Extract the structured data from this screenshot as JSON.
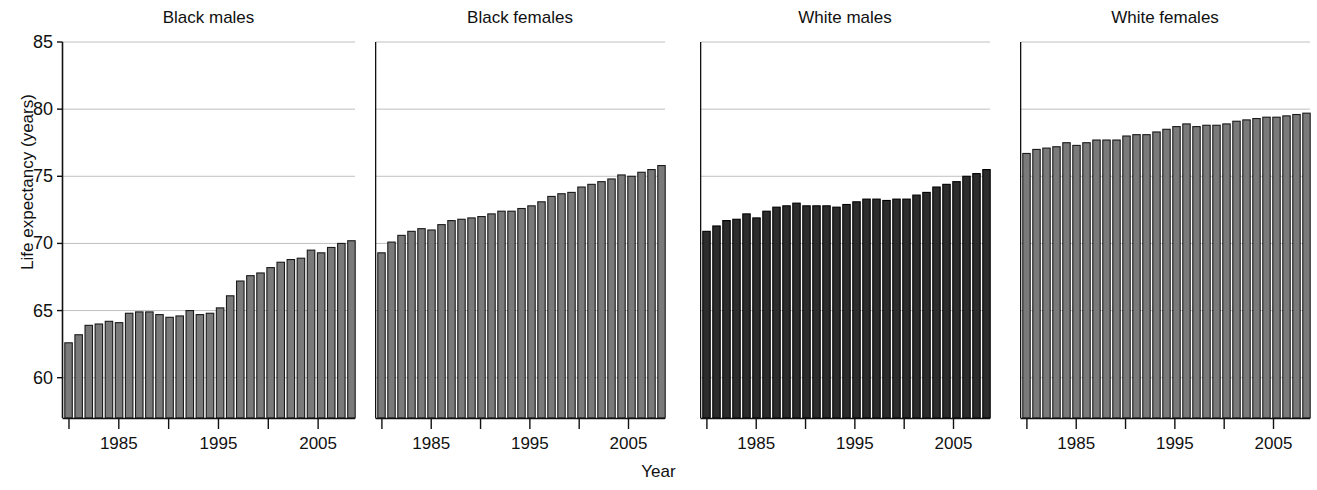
{
  "chart_data": {
    "type": "bar",
    "title": "",
    "xlabel": "Year",
    "ylabel": "Life expectancy (years)",
    "ylim": [
      57,
      85
    ],
    "ytick_values": [
      60,
      65,
      70,
      75,
      80,
      85
    ],
    "ytick_labels": [
      "60",
      "65",
      "70",
      "75",
      "80",
      "85"
    ],
    "xlim": [
      1979.3,
      2008.7
    ],
    "xtick_values": [
      1980,
      1985,
      1990,
      1995,
      2000,
      2005
    ],
    "xtick_labels": [
      "",
      "1985",
      "",
      "1995",
      "",
      "2005"
    ],
    "grid": "horizontal",
    "legend": "none",
    "x": [
      1980,
      1981,
      1982,
      1983,
      1984,
      1985,
      1986,
      1987,
      1988,
      1989,
      1990,
      1991,
      1992,
      1993,
      1994,
      1995,
      1996,
      1997,
      1998,
      1999,
      2000,
      2001,
      2002,
      2003,
      2004,
      2005,
      2006,
      2007,
      2008
    ],
    "panels": [
      {
        "label": "Black males",
        "bar_color": "#7a7a7a",
        "bar_edge_color": "#1a1a1a",
        "values": [
          62.6,
          63.2,
          63.9,
          64.0,
          64.2,
          64.1,
          64.8,
          64.9,
          64.9,
          64.7,
          64.5,
          64.6,
          65.0,
          64.7,
          64.8,
          65.2,
          66.1,
          67.2,
          67.6,
          67.8,
          68.2,
          68.6,
          68.8,
          68.9,
          69.5,
          69.3,
          69.7,
          70.0,
          70.2
        ]
      },
      {
        "label": "Black females",
        "bar_color": "#7a7a7a",
        "bar_edge_color": "#1a1a1a",
        "values": [
          69.3,
          70.1,
          70.6,
          70.9,
          71.1,
          71.0,
          71.4,
          71.7,
          71.8,
          71.9,
          72.0,
          72.2,
          72.4,
          72.4,
          72.6,
          72.8,
          73.1,
          73.5,
          73.7,
          73.8,
          74.2,
          74.4,
          74.6,
          74.8,
          75.1,
          75.0,
          75.3,
          75.5,
          75.8
        ]
      },
      {
        "label": "White males",
        "bar_color": "#2c2c2c",
        "bar_edge_color": "#000000",
        "values": [
          70.9,
          71.3,
          71.7,
          71.8,
          72.2,
          71.9,
          72.4,
          72.7,
          72.8,
          73.0,
          72.8,
          72.8,
          72.8,
          72.7,
          72.9,
          73.1,
          73.3,
          73.3,
          73.2,
          73.3,
          73.3,
          73.6,
          73.8,
          74.2,
          74.4,
          74.6,
          75.0,
          75.2,
          75.5
        ]
      },
      {
        "label": "White females",
        "bar_color": "#7a7a7a",
        "bar_edge_color": "#1a1a1a",
        "values": [
          76.7,
          77.0,
          77.1,
          77.2,
          77.5,
          77.3,
          77.5,
          77.7,
          77.7,
          77.7,
          78.0,
          78.1,
          78.1,
          78.3,
          78.5,
          78.7,
          78.9,
          78.7,
          78.8,
          78.8,
          78.9,
          79.1,
          79.2,
          79.3,
          79.4,
          79.4,
          79.5,
          79.6,
          79.7
        ]
      }
    ]
  },
  "axis": {
    "ylabel": "Life expectancy (years)",
    "xlabel": "Year"
  }
}
